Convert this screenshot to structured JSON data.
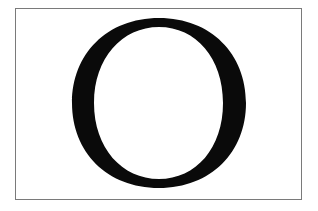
{
  "figure": {
    "letter": "O",
    "colors": {
      "glyph": "#0a0a0a",
      "border": "#7a7a7a",
      "background": "#ffffff"
    }
  }
}
